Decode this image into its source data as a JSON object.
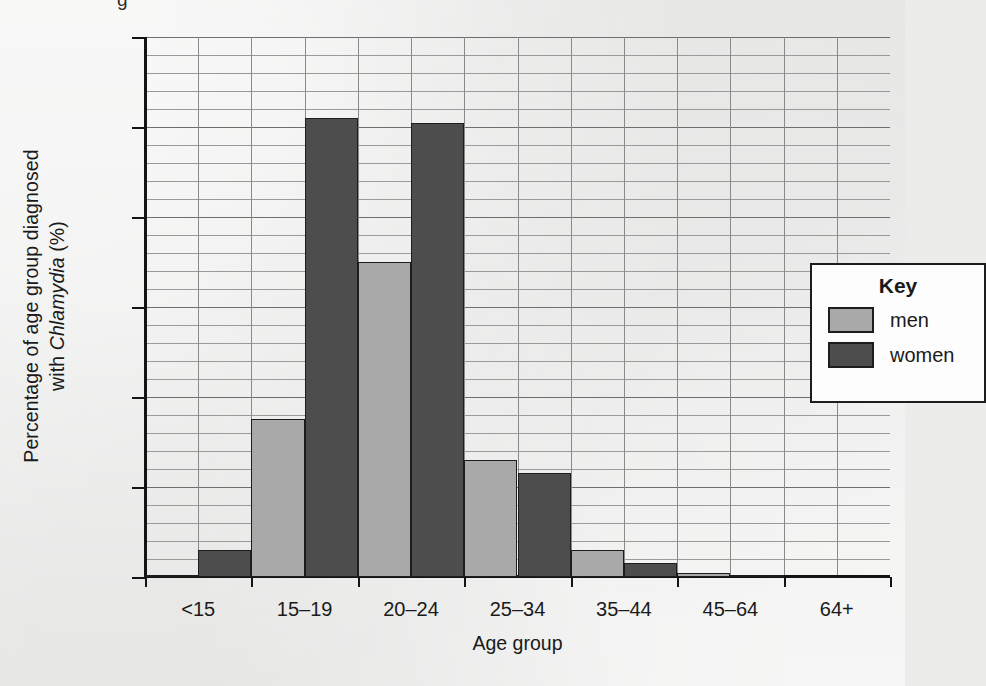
{
  "figure": {
    "top_fragment": "g",
    "background_color": "#ececeb"
  },
  "chart_data": {
    "type": "bar",
    "title": "",
    "xlabel": "Age group",
    "ylabel": "Percentage of age group diagnosed with Chlamydia (%)",
    "ylabel_parts": {
      "line1_pre": "Percentage of age group diagnosed",
      "line2_pre": "with ",
      "line2_italic": "Chlamydia",
      "line2_post": " (%)"
    },
    "categories": [
      "<15",
      "15–19",
      "20–24",
      "25–34",
      "35–44",
      "45–64",
      "64+"
    ],
    "series": [
      {
        "name": "men",
        "color": "#a9a9a9",
        "values": [
          0.01,
          0.88,
          1.75,
          0.65,
          0.15,
          0.025,
          0.0
        ]
      },
      {
        "name": "women",
        "color": "#4d4d4d",
        "values": [
          0.15,
          2.55,
          2.52,
          0.58,
          0.08,
          0.01,
          0.0
        ]
      }
    ],
    "ylim": [
      0.0,
      3.0
    ],
    "ytick_labels": [
      "0.0",
      "0.5",
      "1.0",
      "1.5",
      "2.0",
      "2.5",
      "3.0"
    ],
    "ytick_values": [
      0.0,
      0.5,
      1.0,
      1.5,
      2.0,
      2.5,
      3.0
    ],
    "minor_ytick_step": 0.1,
    "grid": "major and minor horizontal, vertical per half-category",
    "legend_position": "inside upper right"
  },
  "legend": {
    "title": "Key",
    "entries": [
      {
        "label": "men",
        "color": "#a9a9a9"
      },
      {
        "label": "women",
        "color": "#4d4d4d"
      }
    ]
  }
}
